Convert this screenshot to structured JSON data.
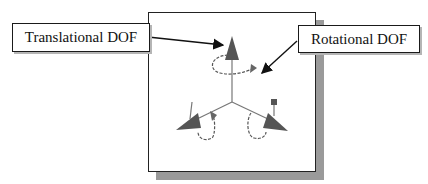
{
  "diagram": {
    "callouts": [
      {
        "id": "translational",
        "label": "Translational DOF"
      },
      {
        "id": "rotational",
        "label": "Rotational DOF"
      }
    ],
    "triad": {
      "description": "3D coordinate triad with cone arrows (translational DOF) and curled arrows (rotational DOF)",
      "axes": [
        "up",
        "lower-left",
        "lower-right"
      ]
    },
    "colors": {
      "cone_fill": "#555555",
      "panel_border": "#222222",
      "panel_shadow": "#9a9a9a",
      "leader_line": "#111111"
    }
  }
}
